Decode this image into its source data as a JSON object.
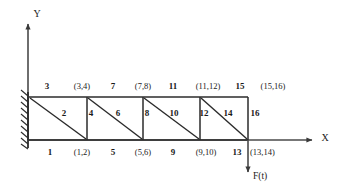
{
  "figure": {
    "type": "cantilever-truss-fe-model",
    "axes": {
      "x_label": "X",
      "y_label": "Y"
    },
    "support": {
      "kind": "fixed-wall-hatched"
    },
    "load": {
      "label": "F(t)",
      "direction": "down"
    },
    "top_chord_elements": [
      "3",
      "7",
      "11",
      "15"
    ],
    "top_node_dofs": [
      "(3,4)",
      "(7,8)",
      "(11,12)",
      "(15,16)"
    ],
    "bottom_chord_elements": [
      "1",
      "5",
      "9",
      "13"
    ],
    "bottom_node_dofs": [
      "(1,2)",
      "(5,6)",
      "(9,10)",
      "(13,14)"
    ],
    "vertical_elements": [
      "4",
      "8",
      "12",
      "16"
    ],
    "diagonal_elements": [
      "2",
      "6",
      "10",
      "14"
    ],
    "labels": {
      "top_row": [
        {
          "text": "3",
          "kind": "elem",
          "x": 47,
          "y": 86
        },
        {
          "text": "(3,4)",
          "kind": "dof",
          "x": 82,
          "y": 86
        },
        {
          "text": "7",
          "kind": "elem",
          "x": 113,
          "y": 86
        },
        {
          "text": "(7,8)",
          "kind": "dof",
          "x": 143,
          "y": 86
        },
        {
          "text": "11",
          "kind": "elem",
          "x": 173,
          "y": 86
        },
        {
          "text": "(11,12)",
          "kind": "dof",
          "x": 208,
          "y": 86
        },
        {
          "text": "15",
          "kind": "elem",
          "x": 240,
          "y": 86
        },
        {
          "text": "(15,16)",
          "kind": "dof",
          "x": 273,
          "y": 86
        }
      ],
      "interior_row": [
        {
          "text": "2",
          "kind": "elem",
          "x": 64,
          "y": 113
        },
        {
          "text": "4",
          "kind": "elem",
          "x": 91,
          "y": 113
        },
        {
          "text": "6",
          "kind": "elem",
          "x": 118,
          "y": 113
        },
        {
          "text": "8",
          "kind": "elem",
          "x": 145,
          "y": 113
        },
        {
          "text": "10",
          "kind": "elem",
          "x": 173,
          "y": 113
        },
        {
          "text": "12",
          "kind": "elem",
          "x": 200,
          "y": 113
        },
        {
          "text": "14",
          "kind": "elem",
          "x": 227,
          "y": 113
        },
        {
          "text": "16",
          "kind": "elem",
          "x": 252,
          "y": 113
        }
      ],
      "bottom_row": [
        {
          "text": "1",
          "kind": "elem",
          "x": 50,
          "y": 152
        },
        {
          "text": "(1,2)",
          "kind": "dof",
          "x": 82,
          "y": 152
        },
        {
          "text": "5",
          "kind": "elem",
          "x": 113,
          "y": 152
        },
        {
          "text": "(5,6)",
          "kind": "dof",
          "x": 143,
          "y": 152
        },
        {
          "text": "9",
          "kind": "elem",
          "x": 173,
          "y": 152
        },
        {
          "text": "(9,10)",
          "kind": "dof",
          "x": 206,
          "y": 152
        },
        {
          "text": "13",
          "kind": "elem",
          "x": 237,
          "y": 152
        },
        {
          "text": "(13,14)",
          "kind": "dof",
          "x": 261,
          "y": 152
        }
      ]
    },
    "geometry": {
      "wall_x": 28,
      "top_y": 97,
      "bottom_y": 140,
      "bay_x": [
        30,
        87,
        143,
        200,
        248
      ],
      "y_axis_x": 28,
      "y_axis_top": 22,
      "x_axis_y": 140,
      "x_axis_right": 318
    }
  }
}
